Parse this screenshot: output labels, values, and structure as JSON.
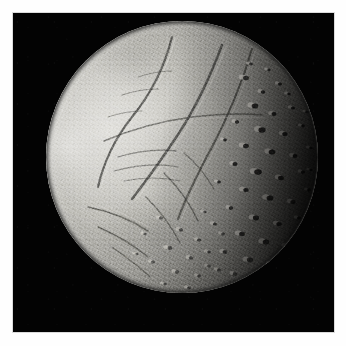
{
  "image": {
    "kind": "natural-image",
    "subject": "planetary-moon-disc",
    "description": "Grayscale spacecraft photograph of an icy moon shown as a gibbous disc against black space",
    "alt_text": "Icy moon disc, brightly lit on the left with long linear canyons and a heavily cratered right side fading into shadow",
    "orientation": "square",
    "frame": {
      "border_color": "#fefefe",
      "border_width_px": 13,
      "field_color": "#030303",
      "field_width_px": 321,
      "field_height_px": 319
    },
    "disc": {
      "center_x_px": 182,
      "center_y_px": 157,
      "diameter_px": 272,
      "illumination": "left-lit-gibbous",
      "terminator_side": "right",
      "phase_label": "gibbous"
    },
    "palette": {
      "space_black": "#030303",
      "border_white": "#fefefe",
      "highlight": "#e2e1dd",
      "bright_terrain": "#d2d1cc",
      "mid_terrain": "#a6a5a0",
      "shadow_terrain": "#4d4d4a",
      "deep_shadow": "#151514"
    },
    "terrain_regions": [
      {
        "name": "smooth-plains",
        "location": "left-and-center",
        "tone": "bright",
        "features": "smooth bright plains crossed by long linear grooves"
      },
      {
        "name": "canyon-system",
        "location": "upper-left-to-center",
        "tone": "mixed",
        "features": "intersecting rift valleys and fault scarps"
      },
      {
        "name": "cratered-highlands",
        "location": "right-and-lower-right",
        "tone": "dark-mottled",
        "features": "densely packed impact craters with lit rims and long shadows"
      },
      {
        "name": "terminator",
        "location": "right-limb",
        "tone": "black",
        "features": "day-night boundary fading to unlit surface"
      }
    ]
  }
}
